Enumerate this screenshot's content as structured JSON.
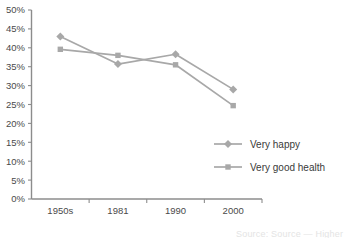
{
  "chart_data": {
    "type": "line",
    "title": "",
    "subtitle": "",
    "xlabel": "",
    "ylabel": "",
    "categories": [
      "1950s",
      "1981",
      "1990",
      "2000"
    ],
    "ylim": [
      0,
      50
    ],
    "ytick_step": 5,
    "ytick_labels": [
      "0%",
      "5%",
      "10%",
      "15%",
      "20%",
      "25%",
      "30%",
      "35%",
      "40%",
      "45%",
      "50%"
    ],
    "ytick_values": [
      0,
      5,
      10,
      15,
      20,
      25,
      30,
      35,
      40,
      45,
      50
    ],
    "grid": false,
    "legend_position": "inside-bottom-right",
    "series": [
      {
        "name": "Very happy",
        "marker": "diamond",
        "color": "#a8a8a8",
        "values": [
          43.0,
          35.7,
          38.3,
          29.0
        ]
      },
      {
        "name": "Very good health",
        "marker": "square",
        "color": "#a8a8a8",
        "values": [
          39.6,
          38.0,
          35.5,
          24.7
        ]
      }
    ],
    "annotations": []
  },
  "footer": {
    "cropped_note": "Source: Source — Higher education"
  },
  "colors": {
    "axis": "#8c8c8c",
    "text": "#4a4a4a",
    "series_gray": "#a8a8a8",
    "background": "#ffffff"
  }
}
